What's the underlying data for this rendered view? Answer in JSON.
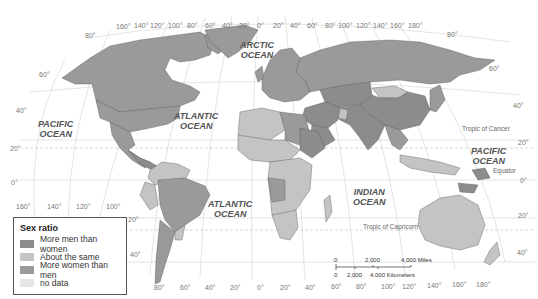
{
  "map": {
    "projection": "Robinson-style world map",
    "colors": {
      "more_men": "#8c8c8c",
      "about_same": "#c4c4c4",
      "more_women": "#9a9a9a",
      "no_data": "#e6e6e6",
      "ocean": "#ffffff",
      "graticule": "#cfcfcf"
    },
    "oceans": [
      {
        "id": "arctic",
        "line1": "ARCTIC",
        "line2": "OCEAN"
      },
      {
        "id": "pacific-north-west",
        "line1": "PACIFIC",
        "line2": "OCEAN"
      },
      {
        "id": "atlantic-north",
        "line1": "ATLANTIC",
        "line2": "OCEAN"
      },
      {
        "id": "pacific-east",
        "line1": "PACIFIC",
        "line2": "OCEAN"
      },
      {
        "id": "indian",
        "line1": "INDIAN",
        "line2": "OCEAN"
      },
      {
        "id": "atlantic-south",
        "line1": "ATLANTIC",
        "line2": "OCEAN"
      }
    ],
    "reference_lines": {
      "tropic_cancer": "Tropic of Cancer",
      "equator": "Equator",
      "tropic_capricorn": "Tropic of Capricorn"
    },
    "top_longitudes_left": [
      "160°",
      "140°",
      "120°",
      "100°",
      "80°",
      "60°",
      "40°",
      "20°",
      "0°"
    ],
    "top_longitudes_right": [
      "20°",
      "40°",
      "60°",
      "80°",
      "100°",
      "120°",
      "140°",
      "160°",
      "180°"
    ],
    "bottom_longitudes_left": [
      "160°",
      "140°",
      "120°",
      "100°"
    ],
    "bottom_longitudes": [
      "80°",
      "60°",
      "40°",
      "20°",
      "0°",
      "20°",
      "40°",
      "60°",
      "80°",
      "100°",
      "120°",
      "140°",
      "160°",
      "180°"
    ],
    "latitudes_left": [
      "80°",
      "60°",
      "40°",
      "20°",
      "0°"
    ],
    "latitudes_left_south": [
      "20°",
      "40°"
    ],
    "latitudes_right": [
      "80°",
      "60°",
      "40°",
      "20°",
      "0°",
      "20°",
      "40°"
    ]
  },
  "legend": {
    "title": "Sex ratio",
    "items": [
      {
        "label": "More men than women",
        "color": "#8c8c8c"
      },
      {
        "label": "About the same",
        "color": "#c4c4c4"
      },
      {
        "label": "More women than men",
        "color": "#9a9a9a"
      },
      {
        "label": "no data",
        "color": "#e6e6e6"
      }
    ]
  },
  "scale_bar": {
    "miles": [
      "0",
      "2,000",
      "4,000 Miles"
    ],
    "kilometers": [
      "0",
      "2,000",
      "4,000 Kilometers"
    ]
  }
}
